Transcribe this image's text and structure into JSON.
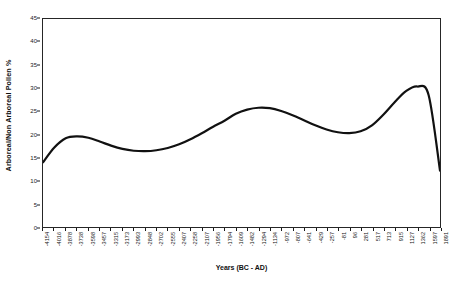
{
  "chart_data": {
    "type": "line",
    "title": "",
    "xlabel": "Years (BC - AD)",
    "ylabel": "Arboreal/Non Arboreal Pollen %",
    "ylim": [
      0,
      45
    ],
    "yticks": [
      0,
      5,
      10,
      15,
      20,
      25,
      30,
      35,
      40,
      45
    ],
    "grid": false,
    "legend": null,
    "categories": [
      "-4154",
      "-4016",
      "-3878",
      "-3738",
      "-3598",
      "-3457",
      "-3315",
      "-3173",
      "-2993",
      "-2848",
      "-2702",
      "-2555",
      "-2407",
      "-2258",
      "-2107",
      "-1956",
      "-1794",
      "-1609",
      "-1482",
      "-1294",
      "-1134",
      "-972",
      "-807",
      "-641",
      "-429",
      "-257",
      "-81",
      "96",
      "281",
      "517",
      "713",
      "915",
      "1127",
      "1362",
      "1597",
      "1891"
    ],
    "series": [
      {
        "name": "Arboreal/Non Arboreal Pollen %",
        "color": "#111111",
        "values": [
          14.0,
          17.2,
          19.2,
          19.6,
          19.3,
          18.5,
          17.6,
          16.9,
          16.5,
          16.4,
          16.6,
          17.1,
          17.9,
          19.0,
          20.3,
          21.7,
          23.0,
          24.5,
          25.4,
          25.8,
          25.7,
          25.1,
          24.2,
          23.1,
          22.0,
          21.1,
          20.5,
          20.3,
          20.7,
          22.0,
          24.3,
          27.0,
          29.4,
          30.4,
          28.5,
          12.2
        ]
      }
    ]
  }
}
